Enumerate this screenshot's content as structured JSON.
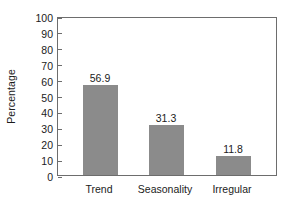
{
  "chart_data": {
    "type": "bar",
    "title": "",
    "subtitle": "",
    "xlabel": "",
    "ylabel": "Percentage",
    "categories": [
      "Trend",
      "Seasonality",
      "Irregular"
    ],
    "values": [
      56.9,
      31.3,
      11.8
    ],
    "value_labels": [
      "56.9",
      "31.3",
      "11.8"
    ],
    "ylim": [
      0,
      100
    ],
    "yticks": [
      0,
      10,
      20,
      30,
      40,
      50,
      60,
      70,
      80,
      90,
      100
    ],
    "ytick_labels": [
      "0",
      "10",
      "20",
      "30",
      "40",
      "50",
      "60",
      "70",
      "80",
      "90",
      "100"
    ],
    "grid": false,
    "legend": null,
    "bar_color": "#8b8b8b",
    "axis_color": "#6d6d6d",
    "text_color": "#1b1b1b",
    "background": "#ffffff"
  }
}
